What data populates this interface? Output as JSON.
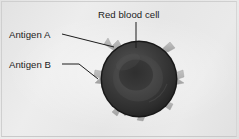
{
  "figure": {
    "background_color": "#e8e8e8",
    "border_color": "#cfcfcf"
  },
  "labels": {
    "red_blood_cell": "Red blood cell",
    "antigen_a": "Antigen A",
    "antigen_b": "Antigen B"
  },
  "cell": {
    "center_x": 139,
    "center_y": 79,
    "radius": 38,
    "rim_color": "#2b2b2b",
    "body_color": "#3a3a3a",
    "depression_color": "#4a4a4a",
    "core_color": "#343434"
  },
  "antigens": {
    "spike_color": "#b4b4b4",
    "spike_shadow": "#9a9a9a",
    "count": 7,
    "angles_deg": [
      218,
      250,
      285,
      318,
      8,
      45,
      160
    ]
  },
  "leaders": {
    "color": "#1c1c1c",
    "antigen_a": {
      "from_x": 62,
      "from_y": 34,
      "to_x": 114,
      "to_y": 47
    },
    "antigen_b": {
      "from_x": 62,
      "from_y": 64,
      "to_x": 79,
      "to_y": 64,
      "elbow_x": 79,
      "elbow_y": 64,
      "end_x": 98,
      "end_y": 78
    },
    "red_blood_cell": {
      "from_x": 136,
      "from_y": 22,
      "to_x": 136,
      "to_y": 48
    }
  }
}
